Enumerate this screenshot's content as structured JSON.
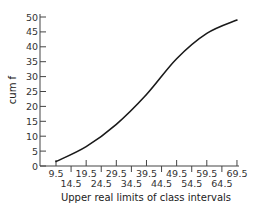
{
  "chart_data": {
    "type": "line",
    "title": "",
    "xlabel": "Upper real limits of class intervals",
    "ylabel": "cum f",
    "x": [
      9.5,
      19.5,
      29.5,
      39.5,
      49.5,
      59.5,
      69.5
    ],
    "series": [
      {
        "name": "cum f",
        "values": [
          1.5,
          6.5,
          14,
          24,
          36,
          44.5,
          49
        ]
      }
    ],
    "x_tick_labels_upper": [
      "9.5",
      "19.5",
      "29.5",
      "39.5",
      "49.5",
      "59.5",
      "69.5"
    ],
    "x_tick_labels_lower": [
      "14.5",
      "24.5",
      "34.5",
      "44.5",
      "54.5",
      "64.5"
    ],
    "x_ticks_all": [
      9.5,
      14.5,
      19.5,
      24.5,
      29.5,
      34.5,
      39.5,
      44.5,
      49.5,
      54.5,
      59.5,
      64.5,
      69.5
    ],
    "y_ticks": [
      0,
      5,
      10,
      15,
      20,
      25,
      30,
      35,
      40,
      45,
      50
    ],
    "ylim": [
      0,
      50
    ],
    "xlim": [
      4.5,
      69.5
    ],
    "grid": false,
    "legend": "none",
    "line_color": "#1a1a1a"
  }
}
